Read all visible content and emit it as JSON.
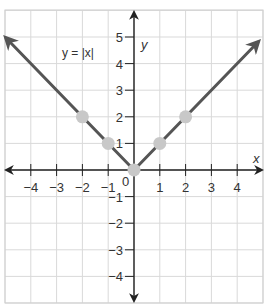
{
  "chart_data": {
    "type": "line",
    "title": "",
    "equation_label": "y = |x|",
    "xlabel": "x",
    "ylabel": "y",
    "xlim": [
      -5,
      5
    ],
    "ylim": [
      -5,
      5.5
    ],
    "x_ticks": [
      -4,
      -3,
      -2,
      -1,
      1,
      2,
      3,
      4
    ],
    "y_ticks": [
      5,
      4,
      3,
      2,
      1,
      -1,
      -2,
      -3,
      -4
    ],
    "x_tick_labels": [
      "−4",
      "−3",
      "−2",
      "−1",
      "1",
      "2",
      "3",
      "4"
    ],
    "y_tick_labels": [
      "5",
      "4",
      "3",
      "2",
      "1",
      "−1",
      "−2",
      "−3",
      "−4"
    ],
    "origin_label": "0",
    "grid": true,
    "series": [
      {
        "name": "y = |x|",
        "function": "abs(x)",
        "x": [
          -5,
          0,
          5
        ],
        "y": [
          5,
          0,
          5
        ],
        "arrows_at_ends": true
      }
    ],
    "highlighted_points": [
      {
        "x": -2,
        "y": 2
      },
      {
        "x": -1,
        "y": 1
      },
      {
        "x": 0,
        "y": 0
      },
      {
        "x": 1,
        "y": 1
      },
      {
        "x": 2,
        "y": 2
      }
    ],
    "colors": {
      "line": "#555555",
      "points": "#c8c8c8",
      "grid": "#d9d9d9",
      "axes": "#222222"
    }
  }
}
